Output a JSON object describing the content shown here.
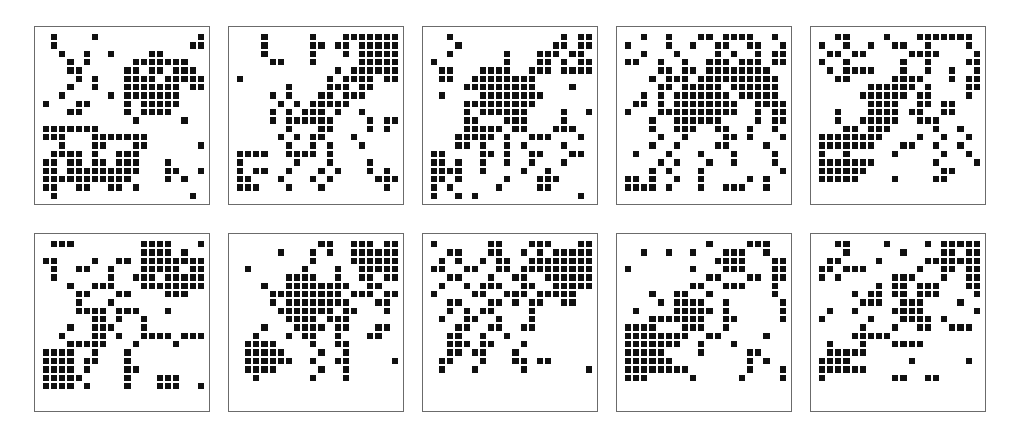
{
  "figure": {
    "type": "binary-lattice-grid-panel-array",
    "panel_rows": 2,
    "panel_cols": 5,
    "panel_count": 10,
    "grid_rows": 20,
    "grid_cols": 20,
    "on_color": "#111111",
    "off_color": "#ffffff",
    "border_color": "#6b6b6b",
    "background_color": "#ffffff"
  },
  "chart_data": {
    "type": "heatmap",
    "title": "",
    "xlabel": "",
    "ylabel": "",
    "legend": [],
    "grid": false,
    "panels": [
      {
        "name": "panel-1",
        "rows": [
          "01000010000000000001",
          "01000000000000000011",
          "00100100100001100000",
          "00010100000111111100",
          "00011000001101101110",
          "00001010001111011111",
          "00010010001111111011",
          "00100000101111111000",
          "10001100001011111000",
          "00011000001011110000",
          "00000000000100000100",
          "11111110000000000000",
          "11100011111110000000",
          "00100011000110000001",
          "01111010011100000000",
          "11011011011100010000",
          "11011111111100011001",
          "11111111111000010100",
          "11001100110100000000",
          "01000000000000000010"
        ]
      },
      {
        "name": "panel-2",
        "rows": [
          "00010000010001111111",
          "00010000011011011111",
          "00010000010001011111",
          "00001100010000011111",
          "00000000000010111111",
          "10000000000101111011",
          "00000010000111011000",
          "00001010001101110000",
          "00000101011111000000",
          "00001010111010010000",
          "00001011111100001011",
          "00000010001100001010",
          "00000101011000100000",
          "00000010010100010000",
          "11110011110100000000",
          "10000001000100001000",
          "10110010001010001010",
          "11000100010100000111",
          "11100010001000000010",
          "00000000000000000000"
        ]
      },
      {
        "name": "panel-3",
        "rows": [
          "00100000000000001011",
          "00010000000000011011",
          "00100000010001110110",
          "10000000010001101011",
          "01100011110011101111",
          "01100111111110000000",
          "00001111111110000100",
          "01000011111111000000",
          "00001111111110000000",
          "00001011111100001001",
          "00001100011100001000",
          "00001111101100011100",
          "00011111010011100010",
          "00011010010100001000",
          "11000011010011000110",
          "11010010010010001000",
          "11110010000100100000",
          "11010000010001110000",
          "10100000100001100000",
          "10010100000000000010"
        ]
      },
      {
        "name": "panel-4",
        "rows": [
          "00100100011011110010",
          "10000100100110011001",
          "00100010000101001011",
          "11001001001110111011",
          "00001101101111111100",
          "00010111011111111110",
          "00001101111101111110",
          "00101011111110111110",
          "01101011111111001111",
          "10001111111111001011",
          "00010011111100001011",
          "00010011100110010010",
          "00001001000011010001",
          "00010010000110000100",
          "01000100010001000010",
          "00001010001001000010",
          "00010100010000000001",
          "11010010010000010100",
          "11110100010011100100",
          "00000000000000000000"
        ]
      },
      {
        "name": "panel-5",
        "rows": [
          "00110000100011111110",
          "10010010011001000010",
          "01101100000111100001",
          "10010000001001000011",
          "01011110001001001001",
          "00110000011110001011",
          "00000011111101000011",
          "00000111111011000010",
          "00000011110011011000",
          "00100011110110011000",
          "00100111110011100000",
          "00011011100000100100",
          "11111111000010010010",
          "11111110001100100100",
          "10010000010000010010",
          "11111110000000100001",
          "11111100000000011000",
          "11111000010000110000",
          "00000000000000000000",
          "00000000000000000000"
        ]
      },
      {
        "name": "panel-6",
        "rows": [
          "01110000000011110001",
          "00000000000011110100",
          "11000010011011111111",
          "01001100100011111011",
          "01000000100111011111",
          "00010011100011111111",
          "00001100011000011100",
          "00001000100000000000",
          "00001111011100010000",
          "00000011010010000000",
          "00010011100010000000",
          "00100011010011110111",
          "00011111000100001000",
          "11110010001000000000",
          "11110110001000000000",
          "11110100001100000000",
          "11111000001000111000",
          "11110100001000111001",
          "00000000000000000000",
          "00000000000000000000"
        ]
      },
      {
        "name": "panel-7",
        "rows": [
          "00000000001100111011",
          "00000100010100111111",
          "00000000010000111111",
          "01000000100010011111",
          "00000011110010011011",
          "00010011111111001100",
          "00001111111110111011",
          "00001011111111000110",
          "00000111111101100010",
          "00000011110111000000",
          "00010001111011000110",
          "00100010110010001100",
          "01111000010011000000",
          "01111100001001000000",
          "01111110010011000001",
          "01111000001001000000",
          "00100000010001000000",
          "00000000000000000000",
          "00000000000000000000",
          "00000000000000000000"
        ]
      },
      {
        "name": "panel-8",
        "rows": [
          "10000001100011100011",
          "00110001100101011111",
          "01010010110011111111",
          "11001100110111111111",
          "00110001001100111111",
          "01001011100110011111",
          "10000110011101111100",
          "00110001101011001100",
          "00101011000010000000",
          "01001100100010000000",
          "00011001100110000000",
          "00110010010000000000",
          "00111011000100000000",
          "00110110001000000000",
          "01100010001101100000",
          "01000100000100000001",
          "00000000000000000000",
          "00000000000000000000",
          "00000000000000000000",
          "00000000000000000000"
        ]
      },
      {
        "name": "panel-9",
        "rows": [
          "00000000001000011100",
          "00100100100011100100",
          "00000000000111100011",
          "10000000100011100011",
          "00000000001100011011",
          "00000000110011100010",
          "00010011001000000010",
          "00001011110010000001",
          "01000011111010000001",
          "00011111110011000001",
          "11110001110010000000",
          "11111111001100000100",
          "11111110010001000000",
          "11111000010000011000",
          "11111100000000010100",
          "11111111000000010001",
          "11100000100000100001",
          "00000000000000000000",
          "00000000000000000000",
          "00000000000000000000"
        ]
      },
      {
        "name": "panel-10",
        "rows": [
          "00110000100001011111",
          "00010000001000011011",
          "01100001000001111111",
          "11011100000010011011",
          "10100000011100010011",
          "00000001011011100011",
          "00001011011011100001",
          "00000111001110000100",
          "01001000011110000001",
          "10000010001111010000",
          "00000100010011001110",
          "00001111100000000000",
          "01000100011110000000",
          "01111100000000000000",
          "11110000000100000010",
          "11111100000000000000",
          "10000000011001100000",
          "00000000000000000000",
          "00000000000000000000",
          "00000000000000000000"
        ]
      }
    ]
  }
}
